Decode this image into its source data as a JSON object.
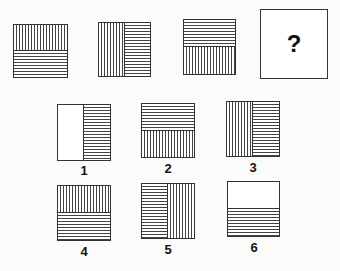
{
  "puzzle": {
    "sequence": [
      {
        "id": "seq-1",
        "split": "horizontal",
        "first": "v-lines",
        "second": "h-lines"
      },
      {
        "id": "seq-2",
        "split": "vertical",
        "first": "v-lines",
        "second": "h-lines"
      },
      {
        "id": "seq-3",
        "split": "horizontal",
        "first": "h-lines",
        "second": "v-lines"
      },
      {
        "id": "seq-4",
        "unknown": true,
        "symbol": "?"
      }
    ],
    "options": [
      {
        "label": "1",
        "split": "vertical",
        "first": "blank",
        "second": "h-lines"
      },
      {
        "label": "2",
        "split": "horizontal",
        "first": "h-lines",
        "second": "v-lines"
      },
      {
        "label": "3",
        "split": "vertical",
        "first": "v-lines",
        "second": "h-lines"
      },
      {
        "label": "4",
        "split": "horizontal",
        "first": "v-lines",
        "second": "h-lines"
      },
      {
        "label": "5",
        "split": "vertical",
        "first": "h-lines",
        "second": "v-lines"
      },
      {
        "label": "6",
        "split": "horizontal",
        "first": "blank",
        "second": "h-lines"
      }
    ]
  }
}
